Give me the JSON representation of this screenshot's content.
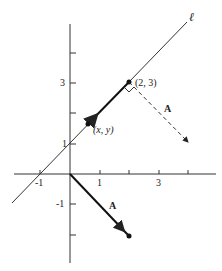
{
  "diagram": {
    "line_label": "ℓ",
    "point_label": "(2, 3)",
    "variable_point_label": "(x, y)",
    "vector_label_top": "A",
    "vector_label_bottom": "A",
    "x_ticks": [
      "-1",
      "1",
      "3"
    ],
    "y_ticks": [
      "3",
      "1",
      "-1"
    ],
    "colors": {
      "ink": "#222222",
      "background": "#ffffff"
    }
  }
}
